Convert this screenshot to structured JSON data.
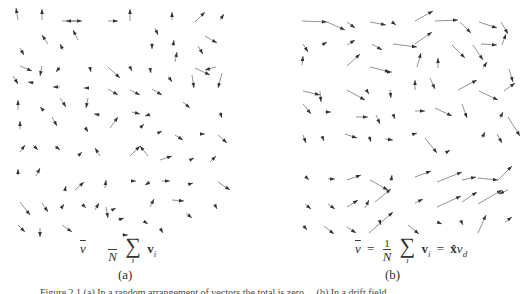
{
  "figure": {
    "panel_a": {
      "label": "(a)",
      "formula": {
        "lhs": "v",
        "frac_numerator": "",
        "frac_denominator": "N",
        "sum_symbol": "∑",
        "sum_index": "i",
        "summand": "v",
        "summand_sub": "i"
      },
      "arrow_color": "#333333",
      "arrows": [
        [
          18,
          20,
          16,
          8
        ],
        [
          42,
          20,
          42,
          9
        ],
        [
          62,
          21,
          82,
          21
        ],
        [
          78,
          21,
          66,
          21
        ],
        [
          108,
          21,
          118,
          21
        ],
        [
          130,
          21,
          130,
          9
        ],
        [
          172,
          20,
          172,
          12
        ],
        [
          195,
          22,
          205,
          12
        ],
        [
          220,
          20,
          224,
          14
        ],
        [
          78,
          40,
          73,
          30
        ],
        [
          48,
          44,
          42,
          35
        ],
        [
          155,
          28,
          158,
          35
        ],
        [
          205,
          36,
          217,
          43
        ],
        [
          20,
          48,
          24,
          55
        ],
        [
          63,
          50,
          60,
          44
        ],
        [
          152,
          43,
          152,
          49
        ],
        [
          173,
          46,
          174,
          40
        ],
        [
          175,
          62,
          177,
          52
        ],
        [
          198,
          46,
          203,
          54
        ],
        [
          20,
          66,
          32,
          71
        ],
        [
          42,
          66,
          40,
          76
        ],
        [
          60,
          67,
          56,
          72
        ],
        [
          90,
          68,
          91,
          72
        ],
        [
          108,
          67,
          120,
          78
        ],
        [
          130,
          67,
          132,
          71
        ],
        [
          150,
          68,
          151,
          73
        ],
        [
          195,
          68,
          210,
          75
        ],
        [
          216,
          67,
          205,
          70
        ],
        [
          13,
          76,
          18,
          84
        ],
        [
          34,
          83,
          28,
          82
        ],
        [
          60,
          87,
          53,
          87
        ],
        [
          88,
          88,
          84,
          88
        ],
        [
          108,
          89,
          118,
          95
        ],
        [
          130,
          90,
          140,
          95
        ],
        [
          152,
          89,
          162,
          95
        ],
        [
          168,
          76,
          172,
          82
        ],
        [
          192,
          75,
          194,
          88
        ],
        [
          222,
          73,
          218,
          88
        ],
        [
          18,
          110,
          18,
          100
        ],
        [
          43,
          110,
          40,
          107
        ],
        [
          60,
          98,
          66,
          107
        ],
        [
          88,
          98,
          86,
          108
        ],
        [
          100,
          115,
          94,
          114
        ],
        [
          132,
          112,
          140,
          114
        ],
        [
          148,
          115,
          145,
          116
        ],
        [
          183,
          102,
          190,
          108
        ],
        [
          220,
          112,
          222,
          118
        ],
        [
          20,
          129,
          20,
          121
        ],
        [
          52,
          117,
          57,
          126
        ],
        [
          85,
          127,
          88,
          132
        ],
        [
          110,
          128,
          118,
          117
        ],
        [
          140,
          128,
          144,
          124
        ],
        [
          160,
          132,
          162,
          131
        ],
        [
          175,
          135,
          183,
          140
        ],
        [
          200,
          134,
          205,
          134
        ],
        [
          218,
          135,
          227,
          143
        ],
        [
          20,
          152,
          25,
          145
        ],
        [
          33,
          145,
          38,
          150
        ],
        [
          55,
          146,
          60,
          150
        ],
        [
          80,
          154,
          82,
          152
        ],
        [
          100,
          156,
          95,
          148
        ],
        [
          130,
          156,
          140,
          146
        ],
        [
          148,
          156,
          140,
          146
        ],
        [
          160,
          160,
          172,
          156
        ],
        [
          192,
          159,
          194,
          158
        ],
        [
          210,
          162,
          216,
          156
        ],
        [
          18,
          175,
          18,
          169
        ],
        [
          36,
          176,
          40,
          168
        ],
        [
          65,
          190,
          66,
          186
        ],
        [
          75,
          190,
          84,
          182
        ],
        [
          105,
          188,
          106,
          180
        ],
        [
          132,
          181,
          136,
          181
        ],
        [
          150,
          182,
          145,
          185
        ],
        [
          162,
          181,
          170,
          181
        ],
        [
          190,
          184,
          193,
          183
        ],
        [
          218,
          182,
          230,
          190
        ],
        [
          20,
          202,
          30,
          215
        ],
        [
          42,
          203,
          48,
          212
        ],
        [
          62,
          207,
          64,
          204
        ],
        [
          84,
          206,
          86,
          208
        ],
        [
          95,
          210,
          99,
          203
        ],
        [
          106,
          207,
          108,
          218
        ],
        [
          112,
          210,
          116,
          208
        ],
        [
          118,
          220,
          124,
          218
        ],
        [
          150,
          207,
          154,
          199
        ],
        [
          172,
          200,
          184,
          201
        ],
        [
          186,
          213,
          192,
          218
        ],
        [
          215,
          205,
          217,
          209
        ],
        [
          18,
          225,
          25,
          232
        ],
        [
          40,
          228,
          40,
          237
        ],
        [
          62,
          225,
          72,
          232
        ],
        [
          122,
          235,
          128,
          235
        ],
        [
          145,
          222,
          148,
          224
        ],
        [
          160,
          228,
          163,
          233
        ]
      ]
    },
    "panel_b": {
      "label": "(b)",
      "formula": {
        "lhs": "v",
        "eq": "=",
        "frac_numerator": "1",
        "frac_denominator": "N",
        "sum_symbol": "∑",
        "sum_index": "i",
        "summand": "v",
        "summand_sub": "i",
        "eq2": "=",
        "rhs_vec": "x̂",
        "rhs_scalar": "v",
        "rhs_sub": "d"
      },
      "arrow_color": "#333333",
      "arrows": [
        [
          37,
          21,
          62,
          22
        ],
        [
          62,
          22,
          80,
          30
        ],
        [
          82,
          22,
          90,
          28
        ],
        [
          105,
          22,
          121,
          25
        ],
        [
          127,
          22,
          131,
          25
        ],
        [
          150,
          21,
          168,
          11
        ],
        [
          170,
          21,
          193,
          20
        ],
        [
          195,
          22,
          206,
          33
        ],
        [
          214,
          22,
          232,
          28
        ],
        [
          236,
          22,
          243,
          34
        ],
        [
          38,
          44,
          43,
          52
        ],
        [
          57,
          45,
          62,
          42
        ],
        [
          82,
          45,
          90,
          40
        ],
        [
          107,
          44,
          117,
          50
        ],
        [
          128,
          44,
          152,
          47
        ],
        [
          150,
          44,
          167,
          32
        ],
        [
          216,
          44,
          232,
          45
        ],
        [
          237,
          45,
          241,
          34
        ],
        [
          37,
          65,
          38,
          56
        ],
        [
          82,
          66,
          95,
          54
        ],
        [
          105,
          67,
          125,
          72
        ],
        [
          126,
          72,
          127,
          72
        ],
        [
          152,
          67,
          156,
          53
        ],
        [
          173,
          68,
          173,
          58
        ],
        [
          187,
          45,
          200,
          58
        ],
        [
          208,
          45,
          218,
          60
        ],
        [
          218,
          68,
          222,
          62
        ],
        [
          244,
          69,
          248,
          82
        ],
        [
          38,
          91,
          55,
          95
        ],
        [
          55,
          91,
          56,
          102
        ],
        [
          82,
          90,
          100,
          100
        ],
        [
          102,
          91,
          104,
          94
        ],
        [
          125,
          90,
          126,
          98
        ],
        [
          150,
          90,
          150,
          80
        ],
        [
          165,
          78,
          170,
          89
        ],
        [
          193,
          90,
          212,
          80
        ],
        [
          214,
          91,
          233,
          100
        ],
        [
          239,
          91,
          250,
          83
        ],
        [
          38,
          104,
          46,
          114
        ],
        [
          60,
          112,
          66,
          112
        ],
        [
          91,
          117,
          103,
          117
        ],
        [
          111,
          115,
          115,
          124
        ],
        [
          128,
          114,
          130,
          119
        ],
        [
          150,
          111,
          160,
          111
        ],
        [
          170,
          108,
          187,
          116
        ],
        [
          197,
          104,
          202,
          118
        ],
        [
          235,
          118,
          238,
          112
        ],
        [
          243,
          117,
          255,
          136
        ],
        [
          38,
          135,
          41,
          143
        ],
        [
          57,
          136,
          59,
          141
        ],
        [
          80,
          134,
          92,
          138
        ],
        [
          104,
          136,
          106,
          142
        ],
        [
          120,
          139,
          128,
          140
        ],
        [
          149,
          134,
          152,
          133
        ],
        [
          160,
          138,
          172,
          153
        ],
        [
          182,
          152,
          185,
          150
        ],
        [
          217,
          138,
          220,
          132
        ],
        [
          232,
          134,
          237,
          143
        ],
        [
          40,
          176,
          44,
          180
        ],
        [
          63,
          179,
          70,
          179
        ],
        [
          82,
          180,
          96,
          175
        ],
        [
          105,
          180,
          123,
          190
        ],
        [
          126,
          181,
          127,
          175
        ],
        [
          150,
          177,
          166,
          171
        ],
        [
          172,
          182,
          197,
          172
        ],
        [
          197,
          180,
          211,
          177
        ],
        [
          213,
          178,
          233,
          180
        ],
        [
          233,
          180,
          247,
          166
        ],
        [
          40,
          204,
          46,
          209
        ],
        [
          63,
          204,
          70,
          209
        ],
        [
          82,
          207,
          93,
          200
        ],
        [
          100,
          208,
          104,
          200
        ],
        [
          110,
          202,
          126,
          189
        ],
        [
          150,
          203,
          158,
          199
        ],
        [
          172,
          207,
          196,
          196
        ],
        [
          197,
          202,
          212,
          192
        ],
        [
          213,
          204,
          237,
          190
        ],
        [
          243,
          190,
          234,
          194
        ],
        [
          38,
          225,
          42,
          230
        ],
        [
          59,
          226,
          69,
          234
        ],
        [
          82,
          227,
          91,
          233
        ],
        [
          104,
          233,
          128,
          212
        ],
        [
          115,
          222,
          116,
          225
        ],
        [
          143,
          225,
          154,
          234
        ],
        [
          172,
          222,
          177,
          224
        ],
        [
          197,
          223,
          198,
          225
        ],
        [
          213,
          233,
          221,
          215
        ],
        [
          240,
          222,
          247,
          217
        ]
      ]
    },
    "caption": "Figure 2.1 (a) In a random arrangement of vectors the total is zero ... (b) In a drift field ..."
  }
}
